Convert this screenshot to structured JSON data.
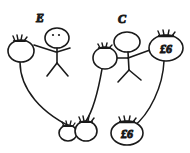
{
  "canvas": {
    "width": 190,
    "height": 153,
    "background": "#ffffff",
    "ink_color": "#1a1a1a"
  },
  "diagram": {
    "figures": [
      {
        "id": "figure-e",
        "label": "E",
        "label_x": 40,
        "label_y": 22,
        "head_cx": 57,
        "head_cy": 38,
        "has_face": true,
        "body_top_y": 46,
        "body_bottom_y": 62,
        "body_x": 57
      },
      {
        "id": "figure-c",
        "label": "C",
        "label_x": 122,
        "label_y": 23,
        "head_cx": 127,
        "head_cy": 42,
        "has_face": false,
        "body_top_y": 52,
        "body_bottom_y": 68,
        "body_x": 129
      }
    ],
    "nodes": [
      {
        "id": "node-left-top",
        "label": "",
        "cx": 21,
        "cy": 51,
        "rx": 13,
        "ry": 11,
        "crown": true
      },
      {
        "id": "node-mid-top",
        "label": "",
        "cx": 105,
        "cy": 58,
        "rx": 12,
        "ry": 11,
        "crown": true
      },
      {
        "id": "node-right-top",
        "label": "£6",
        "cx": 166,
        "cy": 48,
        "rx": 17,
        "ry": 13,
        "crown": true
      },
      {
        "id": "node-bottom-a",
        "label": "",
        "cx": 68,
        "cy": 133,
        "rx": 9,
        "ry": 8,
        "crown": true
      },
      {
        "id": "node-bottom-b",
        "label": "",
        "cx": 86,
        "cy": 131,
        "rx": 11,
        "ry": 10,
        "crown": true
      },
      {
        "id": "node-bottom-right",
        "label": "£6",
        "cx": 127,
        "cy": 133,
        "rx": 16,
        "ry": 12,
        "crown": true
      }
    ],
    "edges": [
      {
        "id": "edge-left-to-bottom",
        "from": "node-left-top",
        "to": "node-bottom-b"
      },
      {
        "id": "edge-mid-to-bottom",
        "from": "node-mid-top",
        "to": "node-bottom-b"
      },
      {
        "id": "edge-right-to-bottom",
        "from": "node-right-top",
        "to": "node-bottom-right"
      }
    ],
    "connectors": [
      {
        "id": "arm-e-to-left-node",
        "from": "figure-e",
        "to": "node-left-top"
      },
      {
        "id": "arm-c-to-mid-node",
        "from": "figure-c",
        "to": "node-mid-top"
      },
      {
        "id": "arm-c-to-right-node",
        "from": "figure-c",
        "to": "node-right-top"
      }
    ]
  }
}
